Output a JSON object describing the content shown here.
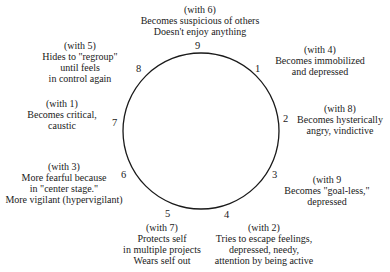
{
  "diagram": {
    "type": "enneagram-circle",
    "circle": {
      "cx": 201,
      "cy": 131,
      "r": 78,
      "stroke": "#1a1a1a"
    },
    "points": [
      {
        "number": "1",
        "with": "(with 4)",
        "lines": [
          "Becomes immobilized",
          "and depressed"
        ]
      },
      {
        "number": "2",
        "with": "(with 8)",
        "lines": [
          "Becomes hysterically",
          "angry, vindictive"
        ]
      },
      {
        "number": "3",
        "with": "(with 9",
        "lines": [
          "Becomes \"goal-less,\"",
          "depressed"
        ]
      },
      {
        "number": "4",
        "with": "(with 2)",
        "lines": [
          "Tries to escape feelings,",
          "depressed, needy,",
          "attention by being active"
        ]
      },
      {
        "number": "5",
        "with": "(with 7)",
        "lines": [
          "Protects self",
          "in multiple projects",
          "Wears self out"
        ]
      },
      {
        "number": "6",
        "with": "(with 3)",
        "lines": [
          "More fearful because",
          "in \"center stage.\"",
          "More vigilant (hypervigilant)"
        ]
      },
      {
        "number": "7",
        "with": "(with 1)",
        "lines": [
          "Becomes critical,",
          "caustic"
        ]
      },
      {
        "number": "8",
        "with": "(with 5)",
        "lines": [
          "Hides to \"regroup\"",
          "until feels",
          "in control again"
        ]
      },
      {
        "number": "9",
        "with": "(with 6)",
        "lines": [
          "Becomes suspicious of others",
          "Doesn't enjoy anything"
        ]
      }
    ]
  }
}
